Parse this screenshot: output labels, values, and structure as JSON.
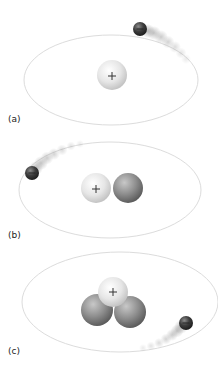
{
  "figure": {
    "panels": [
      {
        "label": "(a)",
        "nucleus": {
          "protons": 1,
          "neutrons": 0,
          "proton_symbol": "+"
        },
        "electron": {
          "symbol": "−",
          "position": "upper-right"
        }
      },
      {
        "label": "(b)",
        "nucleus": {
          "protons": 1,
          "neutrons": 1,
          "proton_symbol": "+"
        },
        "electron": {
          "symbol": "−",
          "position": "left"
        }
      },
      {
        "label": "(c)",
        "nucleus": {
          "protons": 1,
          "neutrons": 2,
          "proton_symbol": "+"
        },
        "electron": {
          "symbol": "−",
          "position": "lower-right"
        }
      }
    ],
    "colors": {
      "proton": "#e8e8e8",
      "neutron": "#8c8c8c",
      "electron": "#3a3a3a",
      "orbit": "#d9d9d9"
    }
  }
}
